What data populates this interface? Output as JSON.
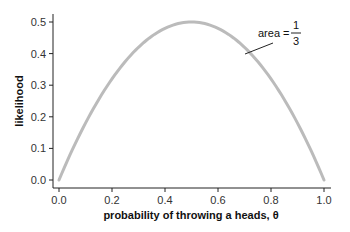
{
  "chart_data": {
    "type": "line",
    "title": "",
    "xlabel": "probability of throwing a heads, θ",
    "ylabel": "likelihood",
    "xlim": [
      0.0,
      1.0
    ],
    "ylim": [
      0.0,
      0.5
    ],
    "xticks": [
      "0.0",
      "0.2",
      "0.4",
      "0.6",
      "0.8",
      "1.0"
    ],
    "yticks": [
      "0.0",
      "0.1",
      "0.2",
      "0.3",
      "0.4",
      "0.5"
    ],
    "grid": false,
    "legend": null,
    "series": [
      {
        "name": "likelihood",
        "formula": "2*theta*(1-theta)",
        "color": "#bbbbbb",
        "x": [
          0.0,
          0.1,
          0.2,
          0.3,
          0.4,
          0.5,
          0.6,
          0.7,
          0.8,
          0.9,
          1.0
        ],
        "y": [
          0.0,
          0.18,
          0.32,
          0.42,
          0.48,
          0.5,
          0.48,
          0.42,
          0.32,
          0.18,
          0.0
        ]
      }
    ],
    "annotations": [
      {
        "text_prefix": "area =",
        "numerator": "1",
        "denominator": "3",
        "points_to_x": 0.83
      }
    ]
  }
}
